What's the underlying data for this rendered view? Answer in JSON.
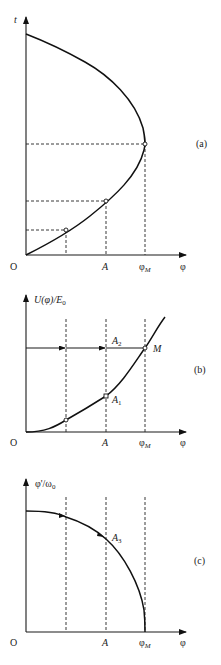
{
  "panels": {
    "a": {
      "tag": "(a)",
      "y_label": "t",
      "origin_label": "O",
      "x_ticks": [
        "A",
        "φ",
        "M"
      ],
      "x_label": "φ",
      "x_tick_A": "A",
      "x_tick_phiM_main": "φ",
      "x_tick_phiM_sub": "M"
    },
    "b": {
      "tag": "(b)",
      "y_label_main": "U(φ)/E",
      "y_label_sub": "0",
      "origin_label": "O",
      "x_tick_A": "A",
      "x_tick_phiM_main": "φ",
      "x_tick_phiM_sub": "M",
      "x_label": "φ",
      "point_A1_main": "A",
      "point_A1_sub": "1",
      "point_A2_main": "A",
      "point_A2_sub": "2",
      "point_M": "M"
    },
    "c": {
      "tag": "(c)",
      "y_label_main": "φ'/ω",
      "y_label_sub": "0",
      "origin_label": "O",
      "x_tick_A": "A",
      "x_tick_phiM_main": "φ",
      "x_tick_phiM_sub": "M",
      "x_label": "φ",
      "point_A3_main": "A",
      "point_A3_sub": "3"
    }
  },
  "colors": {
    "line": "#111111",
    "background": "#ffffff"
  }
}
